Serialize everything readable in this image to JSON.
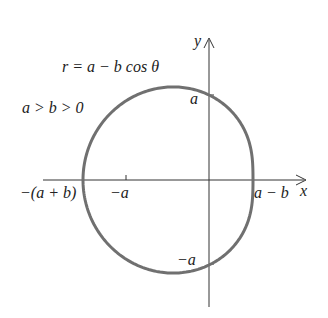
{
  "diagram": {
    "equation": "r = a − b cos θ",
    "condition": "a > b > 0",
    "axes": {
      "x_label": "x",
      "y_label": "y"
    },
    "x_ticks": [
      {
        "label": "−(a + b)",
        "value": "-(a+b)"
      },
      {
        "label": "−a",
        "value": "-a"
      },
      {
        "label": "a − b",
        "value": "a-b"
      }
    ],
    "y_ticks": [
      {
        "label": "a",
        "value": "a"
      },
      {
        "label": "−a",
        "value": "-a"
      }
    ],
    "curve": {
      "type": "limacon",
      "color": "#707070"
    }
  }
}
